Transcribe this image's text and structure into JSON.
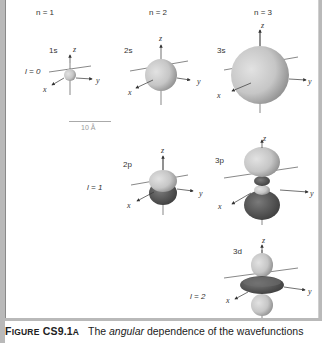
{
  "columns": [
    "n = 1",
    "n = 2",
    "n = 3"
  ],
  "rows": [
    "l = 0",
    "l = 1",
    "l = 2"
  ],
  "orbitals": [
    {
      "name": "1s",
      "n": 1,
      "l": 0
    },
    {
      "name": "2s",
      "n": 2,
      "l": 0
    },
    {
      "name": "3s",
      "n": 3,
      "l": 0
    },
    {
      "name": "2p",
      "n": 2,
      "l": 1
    },
    {
      "name": "3p",
      "n": 3,
      "l": 1
    },
    {
      "name": "3d",
      "n": 3,
      "l": 2
    }
  ],
  "axes": {
    "x": "x",
    "y": "y",
    "z": "z"
  },
  "scale_bar": "10 Å",
  "caption": {
    "figure_label_first": "F",
    "figure_label_rest": "IGURE",
    "figure_number": "CS9.1",
    "figure_suffix": "A",
    "text_before": "The ",
    "emphasis": "angular",
    "text_after": " dependence of the wavefunctions"
  },
  "colors": {
    "light_lobe": "#c9c9c9",
    "dark_lobe": "#4a4a4a",
    "frame": "#b9b9b9"
  }
}
